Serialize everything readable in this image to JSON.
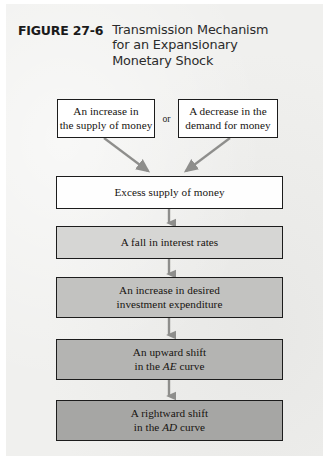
{
  "figure": {
    "number": "FIGURE 27-6",
    "title_lines": [
      "Transmission Mechanism",
      "for an Expansionary",
      "Monetary Shock"
    ]
  },
  "diagram": {
    "type": "flowchart",
    "connector_label": "or",
    "nodes": [
      {
        "id": "money-supply",
        "lines": [
          "An increase in",
          "the supply of money"
        ],
        "fill": "#ffffff",
        "row": "source"
      },
      {
        "id": "money-demand",
        "lines": [
          "A decrease in the",
          "demand for money"
        ],
        "fill": "#ffffff",
        "row": "source"
      },
      {
        "id": "excess-supply",
        "lines": [
          "Excess supply of money"
        ],
        "fill": "#fefefe",
        "row": "chain"
      },
      {
        "id": "interest-rates",
        "lines": [
          "A fall in interest rates"
        ],
        "fill": "#d6d6d4",
        "row": "chain"
      },
      {
        "id": "investment",
        "lines": [
          "An increase in desired",
          "investment expenditure"
        ],
        "fill": "#c2c2c0",
        "row": "chain"
      },
      {
        "id": "ae-shift",
        "lines": [
          "An upward shift",
          "in the AE curve"
        ],
        "italic_terms": [
          "AE"
        ],
        "fill": "#b4b4b2",
        "row": "chain"
      },
      {
        "id": "ad-shift",
        "lines": [
          "A rightward shift",
          "in the AD curve"
        ],
        "italic_terms": [
          "AD"
        ],
        "fill": "#a6a6a4",
        "row": "chain"
      }
    ],
    "edges": [
      {
        "from": "money-supply",
        "to": "excess-supply",
        "style": "diagonal-right"
      },
      {
        "from": "money-demand",
        "to": "excess-supply",
        "style": "diagonal-left"
      },
      {
        "from": "excess-supply",
        "to": "interest-rates",
        "style": "vertical"
      },
      {
        "from": "interest-rates",
        "to": "investment",
        "style": "vertical"
      },
      {
        "from": "investment",
        "to": "ae-shift",
        "style": "vertical"
      },
      {
        "from": "ae-shift",
        "to": "ad-shift",
        "style": "vertical"
      }
    ],
    "arrow_color": "#8e8e8c",
    "border_color": "#1c1c1c",
    "page_background": "#f0f0ee"
  }
}
